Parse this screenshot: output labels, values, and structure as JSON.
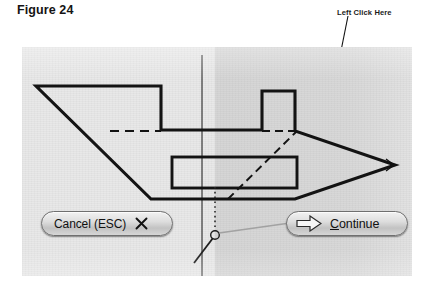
{
  "figure": {
    "caption": "Figure 24"
  },
  "annotation": {
    "label": "Left Click Here",
    "target": "continue-button"
  },
  "canvas": {
    "name": "cad-drawing-canvas",
    "background_color": "#e8e8e8",
    "shade_color": "#b9b9b9",
    "line_color": "#1a1a1a",
    "crosshair": {
      "x": 202,
      "y_top": 8,
      "y_bottom": 229,
      "snap_marker_x": 202,
      "snap_marker_y": 186
    },
    "geometry": {
      "type": "2d-profile",
      "outline_points": "36,86 161,86 161,130 262,130 262,91 295,91 295,131 373,165 295,199 151,199 36,86",
      "hidden_lines": [
        "110,131 161,131",
        "262,131 295,131",
        "228,199 296,131"
      ],
      "inner_rectangle": {
        "x": 172,
        "y": 157,
        "width": 125,
        "height": 31
      },
      "chevron_tip_x": 395,
      "chevron_tip_y": 165
    }
  },
  "buttons": {
    "cancel": {
      "label": "Cancel (ESC)",
      "icon": "close-x-icon",
      "shortcut": "ESC"
    },
    "continue": {
      "label_accel": "C",
      "label_rest": "ontinue",
      "icon": "arrow-right-icon"
    }
  },
  "colors": {
    "page_background": "#ffffff",
    "text": "#141414",
    "button_border": "#6f6f6f"
  }
}
